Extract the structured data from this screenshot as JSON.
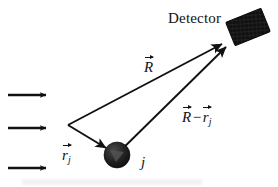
{
  "figure": {
    "kind": "physics-scattering-diagram",
    "background_color": "#ffffff",
    "ink_color": "#111111",
    "width": 278,
    "height": 187
  },
  "labels": {
    "detector": "Detector",
    "scatterer_index": "j",
    "vector_R": {
      "base": "R",
      "subscript": "",
      "accent": "vector-arrow"
    },
    "vector_rj": {
      "base": "r",
      "subscript": "j",
      "accent": "vector-arrow"
    },
    "vector_R_minus_rj": {
      "minus": "−",
      "left": {
        "base": "R",
        "subscript": "",
        "accent": "vector-arrow"
      },
      "right": {
        "base": "r",
        "subscript": "j",
        "accent": "vector-arrow"
      }
    }
  },
  "elements": {
    "incident_beam": {
      "name": "incident-plane-wave-arrows",
      "count": 3,
      "color": "#111111",
      "arrows": [
        {
          "x1": 8,
          "y1": 95,
          "x2": 48,
          "y2": 95
        },
        {
          "x1": 8,
          "y1": 128,
          "x2": 48,
          "y2": 128
        },
        {
          "x1": 8,
          "y1": 168,
          "x2": 48,
          "y2": 168
        }
      ]
    },
    "origin_vertex": {
      "x": 68,
      "y": 125
    },
    "scatterer": {
      "name": "scattering-atom",
      "cx": 117,
      "cy": 155,
      "r": 13,
      "fill": "#1a1a1a"
    },
    "detector_block": {
      "name": "detector-block",
      "cx": 248,
      "cy": 27,
      "width": 38,
      "height": 25,
      "rotation_deg": -22,
      "fill": "#151515"
    },
    "vectors": [
      {
        "name": "R",
        "x1": 68,
        "y1": 125,
        "x2": 226,
        "y2": 42
      },
      {
        "name": "r_j",
        "x1": 68,
        "y1": 125,
        "x2": 107,
        "y2": 149
      },
      {
        "name": "R-r_j",
        "x1": 112,
        "y1": 158,
        "x2": 230,
        "y2": 44
      }
    ]
  }
}
